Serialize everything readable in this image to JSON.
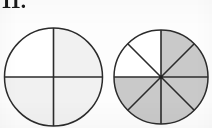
{
  "page": {
    "width": 212,
    "height": 128,
    "background_color": "#fdfdfd",
    "problem_number": "11."
  },
  "colors": {
    "stroke": "#2b2b2b",
    "circle1_shaded_fill": "#f1f1f1",
    "circle1_unshaded_fill": "#ffffff",
    "circle2_shaded_fill": "#c9c9c9",
    "circle2_unshaded_fill": "#ffffff"
  },
  "chart_data": {
    "type": "pie",
    "title": "11.",
    "xlabel": "",
    "ylabel": "",
    "charts": [
      {
        "name": "circle-left",
        "label": "",
        "total_parts": 4,
        "shaded_parts": 3,
        "fraction": "3/4",
        "center_x": 53.5,
        "center_y": 77,
        "radius": 49,
        "clipped_at_bottom": true,
        "categories": [
          "top-left",
          "top-right",
          "bottom-left",
          "bottom-right"
        ],
        "values": [
          25,
          25,
          25,
          25
        ],
        "shaded": [
          true,
          true,
          true,
          false
        ],
        "divider_angles_deg": [
          0,
          90,
          180,
          270
        ],
        "fill_shaded": "#f1f1f1",
        "fill_unshaded": "#ffffff"
      },
      {
        "name": "circle-right",
        "label": "",
        "total_parts": 8,
        "shaded_parts": 6,
        "fraction": "6/8",
        "center_x": 161,
        "center_y": 77,
        "radius": 47,
        "clipped_at_bottom": true,
        "categories": [
          "s1",
          "s2",
          "s3",
          "s4",
          "s5",
          "s6",
          "s7",
          "s8"
        ],
        "values": [
          12.5,
          12.5,
          12.5,
          12.5,
          12.5,
          12.5,
          12.5,
          12.5
        ],
        "shaded": [
          true,
          true,
          true,
          true,
          true,
          true,
          false,
          false
        ],
        "divider_angles_deg": [
          0,
          45,
          90,
          135,
          180,
          225,
          270,
          315
        ],
        "fill_shaded": "#c9c9c9",
        "fill_unshaded": "#ffffff"
      }
    ],
    "legend": [],
    "grid": false
  }
}
